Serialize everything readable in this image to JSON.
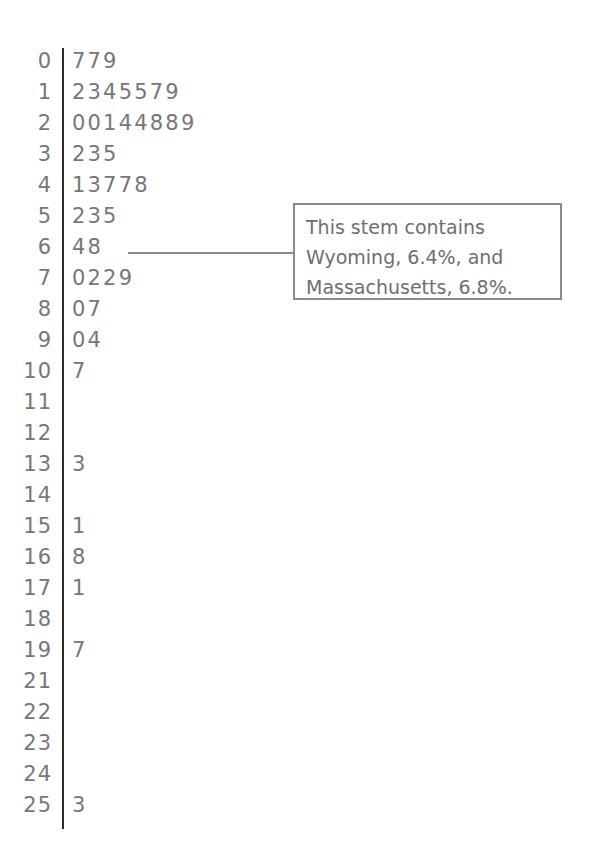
{
  "chart_data": {
    "type": "table",
    "title": "",
    "xlabel": "",
    "ylabel": "",
    "plot_type": "stem-and-leaf",
    "stem_label": "stem",
    "leaf_label": "leaf",
    "rows": [
      {
        "stem": "0",
        "leaves": "779"
      },
      {
        "stem": "1",
        "leaves": "2345579"
      },
      {
        "stem": "2",
        "leaves": "00144889"
      },
      {
        "stem": "3",
        "leaves": "235"
      },
      {
        "stem": "4",
        "leaves": "13778"
      },
      {
        "stem": "5",
        "leaves": "235"
      },
      {
        "stem": "6",
        "leaves": "48"
      },
      {
        "stem": "7",
        "leaves": "0229"
      },
      {
        "stem": "8",
        "leaves": "07"
      },
      {
        "stem": "9",
        "leaves": "04"
      },
      {
        "stem": "10",
        "leaves": "7"
      },
      {
        "stem": "11",
        "leaves": ""
      },
      {
        "stem": "12",
        "leaves": ""
      },
      {
        "stem": "13",
        "leaves": "3"
      },
      {
        "stem": "14",
        "leaves": ""
      },
      {
        "stem": "15",
        "leaves": "1"
      },
      {
        "stem": "16",
        "leaves": "8"
      },
      {
        "stem": "17",
        "leaves": "1"
      },
      {
        "stem": "18",
        "leaves": ""
      },
      {
        "stem": "19",
        "leaves": "7"
      },
      {
        "stem": "21",
        "leaves": ""
      },
      {
        "stem": "22",
        "leaves": ""
      },
      {
        "stem": "23",
        "leaves": ""
      },
      {
        "stem": "24",
        "leaves": ""
      },
      {
        "stem": "25",
        "leaves": "3"
      }
    ],
    "annotations": [
      {
        "target_stem": "6",
        "lines": [
          "This stem contains",
          "Wyoming, 6.4%, and",
          "Massachusetts, 6.8%."
        ]
      }
    ],
    "colors": {
      "text": "#76767a",
      "divider": "#2b2b2b",
      "callout_border": "#8a8a8e",
      "background": "#ffffff"
    }
  }
}
